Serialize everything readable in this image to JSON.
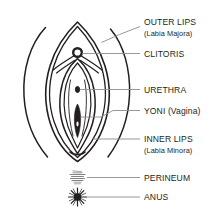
{
  "figure": {
    "line_color": "#231f20",
    "leader_color": "#8d8d8d",
    "background": "#ffffff"
  },
  "labels": [
    {
      "id": "outer-lips",
      "main": "OUTER LIPS",
      "sub": "(Labia Majora)"
    },
    {
      "id": "clitoris",
      "main": "CLITORIS",
      "sub": ""
    },
    {
      "id": "urethra",
      "main": "URETHRA",
      "sub": ""
    },
    {
      "id": "yoni",
      "main": "YONI (Vagina)",
      "sub": ""
    },
    {
      "id": "inner-lips",
      "main": "INNER LIPS",
      "sub": "(Labia Minora)"
    },
    {
      "id": "perineum",
      "main": "PERINEUM",
      "sub": ""
    },
    {
      "id": "anus",
      "main": "ANUS",
      "sub": ""
    }
  ],
  "parts": {
    "outer_lips": "outer-labia-contour",
    "inner_lips": "inner-labia-contour",
    "clitoris": "clitoris-marker",
    "urethra": "urethra-marker",
    "vagina": "vaginal-opening-marker",
    "perineum": "perineum-texture-marker",
    "anus": "anus-starburst-marker"
  }
}
